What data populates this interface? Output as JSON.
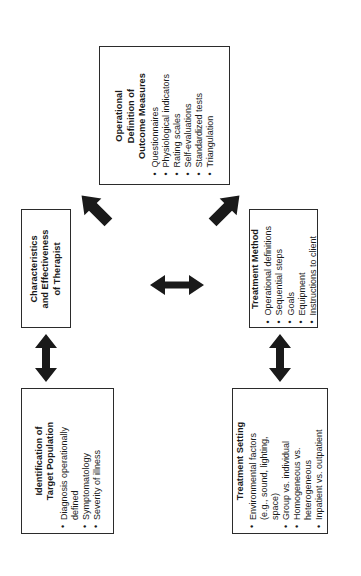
{
  "diagram": {
    "orientation": "rotated-90-ccw",
    "colors": {
      "box_border": "#2b2b2b",
      "arrow": "#1a1a1a",
      "background": "#ffffff",
      "text": "#1a1a1a"
    },
    "boxes": [
      {
        "id": "outcome-measures",
        "title": "Operational\nDefinition of\nOutcome Measures",
        "bullets": [
          "Questionnaires",
          "Physiological indicators",
          "Rating scales",
          "Self-evaluations",
          "Standardized tests",
          "Triangulation"
        ]
      },
      {
        "id": "therapist",
        "title": "Characteristics\nand Effectiveness\nof Therapist",
        "bullets": []
      },
      {
        "id": "treatment-method",
        "title": "Treatment Method",
        "bullets": [
          "Operational definitions",
          "Sequential steps",
          "Goals",
          "Equipment",
          "Instructions to client"
        ]
      },
      {
        "id": "target-population",
        "title": "Identification of\nTarget Population",
        "bullets": [
          "Diagnosis operationally",
          "defined",
          "Symptomatology",
          "Severity of illness"
        ],
        "bullet_flags": [
          true,
          false,
          true,
          true
        ]
      },
      {
        "id": "treatment-setting",
        "title": "Treatment Setting",
        "bullets": [
          "Environmental factors",
          "(e.g., sound, lighting,",
          "space)",
          "Group vs. individual",
          "Homogeneous vs.",
          "heterogeneous",
          "Inpatient vs. outpatient"
        ],
        "bullet_flags": [
          true,
          false,
          false,
          true,
          true,
          false,
          true
        ]
      }
    ],
    "arrows": [
      {
        "id": "therapist-to-outcome",
        "kind": "single",
        "direction": "up-right"
      },
      {
        "id": "method-to-outcome",
        "kind": "single",
        "direction": "up-left"
      },
      {
        "id": "therapist-to-method",
        "kind": "double",
        "direction": "horizontal"
      },
      {
        "id": "therapist-to-population",
        "kind": "double",
        "direction": "vertical"
      },
      {
        "id": "method-to-setting",
        "kind": "double",
        "direction": "vertical"
      }
    ]
  }
}
